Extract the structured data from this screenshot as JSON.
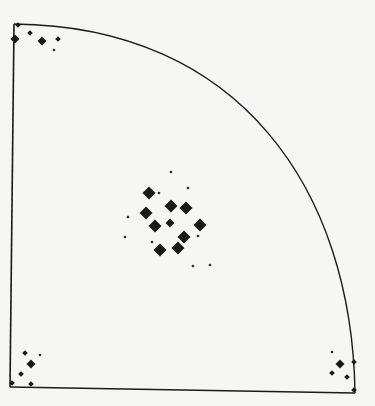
{
  "figure": {
    "background": "#f6f6f4",
    "ink": "#1a1a1a",
    "frame": {
      "corner_top_left": [
        14,
        24
      ],
      "corner_bottom_left": [
        10,
        387
      ],
      "corner_bottom_right": [
        355,
        393
      ],
      "arc_ctrl": [
        240,
        26,
        352,
        190
      ]
    },
    "legend_sizes": {
      "large": 6.5,
      "medium": 4.5,
      "small": 2.8,
      "tiny": 1.6
    },
    "marker_groups": [
      {
        "name": "top-left-cluster",
        "points": [
          {
            "x": 18,
            "y": 25,
            "size": "small"
          },
          {
            "x": 15,
            "y": 39,
            "size": "medium"
          },
          {
            "x": 30,
            "y": 33,
            "size": "small"
          },
          {
            "x": 42,
            "y": 41,
            "size": "medium"
          },
          {
            "x": 58,
            "y": 39,
            "size": "small"
          },
          {
            "x": 54,
            "y": 50,
            "size": "tiny"
          }
        ]
      },
      {
        "name": "center-cluster",
        "points": [
          {
            "x": 171,
            "y": 172,
            "size": "tiny"
          },
          {
            "x": 188,
            "y": 188,
            "size": "tiny"
          },
          {
            "x": 149,
            "y": 193,
            "size": "large"
          },
          {
            "x": 159,
            "y": 193,
            "size": "tiny"
          },
          {
            "x": 171,
            "y": 206,
            "size": "large"
          },
          {
            "x": 186,
            "y": 208,
            "size": "large"
          },
          {
            "x": 146,
            "y": 213,
            "size": "large"
          },
          {
            "x": 128,
            "y": 217,
            "size": "tiny"
          },
          {
            "x": 155,
            "y": 226,
            "size": "large"
          },
          {
            "x": 170,
            "y": 223,
            "size": "medium"
          },
          {
            "x": 200,
            "y": 225,
            "size": "large"
          },
          {
            "x": 125,
            "y": 237,
            "size": "tiny"
          },
          {
            "x": 184,
            "y": 237,
            "size": "large"
          },
          {
            "x": 198,
            "y": 236,
            "size": "tiny"
          },
          {
            "x": 152,
            "y": 242,
            "size": "tiny"
          },
          {
            "x": 160,
            "y": 250,
            "size": "large"
          },
          {
            "x": 178,
            "y": 248,
            "size": "large"
          },
          {
            "x": 193,
            "y": 266,
            "size": "tiny"
          },
          {
            "x": 210,
            "y": 265,
            "size": "tiny"
          }
        ]
      },
      {
        "name": "bottom-left-cluster",
        "points": [
          {
            "x": 25,
            "y": 353,
            "size": "small"
          },
          {
            "x": 40,
            "y": 355,
            "size": "tiny"
          },
          {
            "x": 31,
            "y": 364,
            "size": "medium"
          },
          {
            "x": 21,
            "y": 374,
            "size": "small"
          },
          {
            "x": 12,
            "y": 383,
            "size": "small"
          },
          {
            "x": 31,
            "y": 384,
            "size": "small"
          }
        ]
      },
      {
        "name": "bottom-right-cluster",
        "points": [
          {
            "x": 332,
            "y": 352,
            "size": "tiny"
          },
          {
            "x": 340,
            "y": 364,
            "size": "medium"
          },
          {
            "x": 354,
            "y": 362,
            "size": "small"
          },
          {
            "x": 332,
            "y": 373,
            "size": "small"
          },
          {
            "x": 347,
            "y": 377,
            "size": "small"
          },
          {
            "x": 354,
            "y": 390,
            "size": "small"
          }
        ]
      }
    ]
  }
}
